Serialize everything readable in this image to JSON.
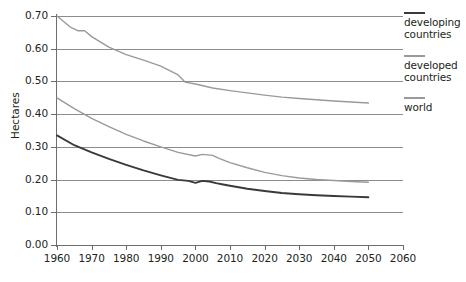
{
  "chart_data": {
    "type": "line",
    "title": "",
    "xlabel": "",
    "ylabel": "Hectares",
    "xlim": [
      1960,
      2060
    ],
    "ylim": [
      0.0,
      0.7
    ],
    "grid": true,
    "legend_position": "right",
    "x_ticks": [
      1960,
      1970,
      1980,
      1990,
      2000,
      2010,
      2020,
      2030,
      2040,
      2050,
      2060
    ],
    "y_ticks": [
      "0.00",
      "0.10",
      "0.20",
      "0.30",
      "0.40",
      "0.50",
      "0.60",
      "0.70"
    ],
    "series": [
      {
        "name": "world",
        "color": "#9a9a9a",
        "x": [
          1960,
          1964,
          1966,
          1968,
          1970,
          1975,
          1980,
          1985,
          1990,
          1995,
          1997,
          2000,
          2005,
          2010,
          2015,
          2020,
          2025,
          2030,
          2035,
          2040,
          2045,
          2050
        ],
        "values": [
          0.7,
          0.665,
          0.655,
          0.655,
          0.637,
          0.605,
          0.582,
          0.565,
          0.547,
          0.52,
          0.498,
          0.492,
          0.48,
          0.472,
          0.465,
          0.458,
          0.452,
          0.448,
          0.444,
          0.44,
          0.437,
          0.434
        ]
      },
      {
        "name": "developed countries",
        "color": "#9a9a9a",
        "x": [
          1960,
          1965,
          1970,
          1975,
          1980,
          1985,
          1990,
          1995,
          2000,
          2002,
          2005,
          2007,
          2010,
          2015,
          2020,
          2025,
          2030,
          2035,
          2040,
          2045,
          2050
        ],
        "values": [
          0.45,
          0.417,
          0.387,
          0.362,
          0.338,
          0.318,
          0.3,
          0.283,
          0.272,
          0.277,
          0.274,
          0.264,
          0.252,
          0.236,
          0.222,
          0.212,
          0.205,
          0.2,
          0.197,
          0.194,
          0.192
        ]
      },
      {
        "name": "developing countries",
        "color": "#3a3a3a",
        "x": [
          1960,
          1965,
          1970,
          1975,
          1980,
          1985,
          1990,
          1995,
          1998,
          2000,
          2002,
          2004,
          2006,
          2008,
          2010,
          2015,
          2020,
          2025,
          2030,
          2035,
          2040,
          2045,
          2050
        ],
        "values": [
          0.335,
          0.305,
          0.283,
          0.263,
          0.245,
          0.228,
          0.213,
          0.199,
          0.196,
          0.19,
          0.196,
          0.194,
          0.189,
          0.185,
          0.181,
          0.172,
          0.165,
          0.159,
          0.155,
          0.152,
          0.15,
          0.148,
          0.146
        ]
      }
    ]
  },
  "legend": {
    "items": [
      {
        "label_line1": "developing",
        "label_line2": "countries",
        "color": "#3a3a3a"
      },
      {
        "label_line1": "developed",
        "label_line2": "countries",
        "color": "#9a9a9a"
      },
      {
        "label_line1": "world",
        "label_line2": "",
        "color": "#9a9a9a"
      }
    ]
  }
}
